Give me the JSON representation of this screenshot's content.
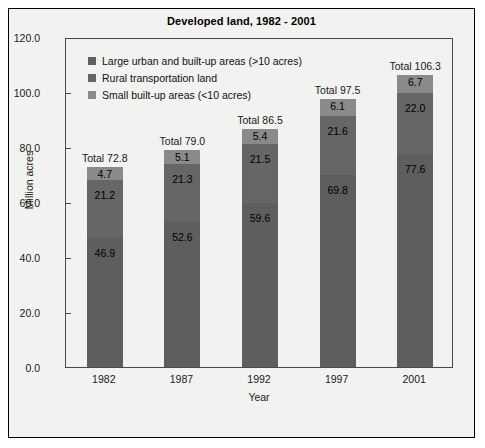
{
  "chart_data": {
    "type": "bar",
    "title": "Developed land, 1982 - 2001",
    "xlabel": "Year",
    "ylabel": "Million acres",
    "categories": [
      "1982",
      "1987",
      "1992",
      "1997",
      "2001"
    ],
    "ylim": [
      0,
      120
    ],
    "ytick_labels": [
      "0.0",
      "20.0",
      "40.0",
      "60.0",
      "80.0",
      "100.0",
      "120.0"
    ],
    "ytick_values": [
      0,
      20,
      40,
      60,
      80,
      100,
      120
    ],
    "grid": false,
    "stacked": true,
    "legend_position": "upper-left-inside",
    "series": [
      {
        "name": "Large urban and built-up areas (>10 acres)",
        "color": "#5e5e5e",
        "values": [
          46.9,
          52.6,
          59.6,
          69.8,
          77.6
        ]
      },
      {
        "name": "Rural transportation land",
        "color": "#666666",
        "values": [
          21.2,
          21.3,
          21.5,
          21.6,
          22.0
        ]
      },
      {
        "name": "Small built-up areas (<10 acres)",
        "color": "#8a8a8a",
        "values": [
          4.7,
          5.1,
          5.4,
          6.1,
          6.7
        ]
      }
    ],
    "totals": [
      72.8,
      79.0,
      86.5,
      97.5,
      106.3
    ],
    "total_labels": [
      "Total 72.8",
      "Total 79.0",
      "Total 86.5",
      "Total 97.5",
      "Total 106.3"
    ],
    "segment_labels": {
      "1982": {
        "top": "4.7",
        "middle": "21.2",
        "bottom": "46.9"
      },
      "1987": {
        "top": "5.1",
        "middle": "21.3",
        "bottom": "52.6"
      },
      "1992": {
        "top": "5.4",
        "middle": "21.5",
        "bottom": "59.6"
      },
      "1997": {
        "top": "6.1",
        "middle": "21.6",
        "bottom": "69.8"
      },
      "2001": {
        "top": "6.7",
        "middle": "22.0",
        "bottom": "77.6"
      }
    }
  },
  "legend": {
    "items": [
      {
        "label": "Large urban and built-up areas (>10 acres)",
        "color": "#5e5e5e"
      },
      {
        "label": "Rural transportation land",
        "color": "#666666"
      },
      {
        "label": "Small built-up areas (<10 acres)",
        "color": "#8a8a8a"
      }
    ]
  },
  "colors": {
    "figure_background": "#f2f2f0",
    "figure_border": "#000000",
    "axis": "#4a4a4a",
    "text": "#1a1a1a",
    "segment_top": "#8a8a8a",
    "segment_middle": "#666666",
    "segment_bottom": "#5e5e5e"
  }
}
